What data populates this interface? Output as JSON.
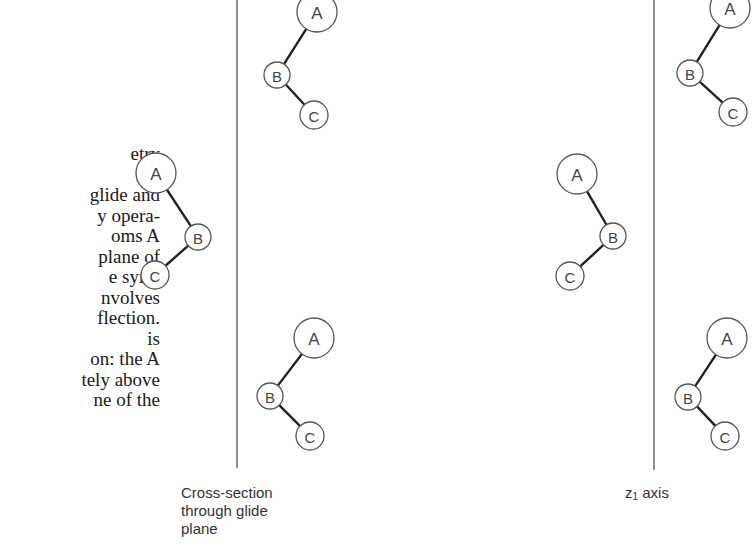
{
  "caption": {
    "lines": [
      "etry",
      "ing",
      "glide and",
      "y opera-",
      "oms A",
      "plane of",
      "e sym-",
      "nvolves",
      "flection.",
      "is",
      "on: the A",
      "tely above",
      "ne of the"
    ]
  },
  "diagram": {
    "panels": [
      {
        "label_lines": [
          "Cross-section",
          "through glide",
          "plane"
        ],
        "axis_x": 237
      },
      {
        "label_prefix": "z",
        "label_subscript": "1",
        "label_suffix": " axis",
        "axis_x": 654
      }
    ],
    "atom_labels": {
      "a": "A",
      "b": "B",
      "c": "C"
    },
    "molecules": [
      {
        "name": "left",
        "A": [
          156,
          173
        ],
        "B": [
          198,
          237
        ],
        "C": [
          155,
          275
        ]
      },
      {
        "name": "center-top",
        "A": [
          317,
          12
        ],
        "B": [
          277,
          75
        ],
        "C": [
          314,
          115
        ]
      },
      {
        "name": "center-bottom",
        "A": [
          314,
          338
        ],
        "B": [
          270,
          396
        ],
        "C": [
          310,
          436
        ]
      },
      {
        "name": "mid-right",
        "A": [
          577,
          174
        ],
        "B": [
          613,
          236
        ],
        "C": [
          570,
          276
        ]
      },
      {
        "name": "right-top",
        "A": [
          730,
          8
        ],
        "B": [
          690,
          73
        ],
        "C": [
          733,
          112
        ]
      },
      {
        "name": "right-bottom",
        "A": [
          727,
          338
        ],
        "B": [
          688,
          397
        ],
        "C": [
          725,
          436
        ]
      }
    ]
  }
}
